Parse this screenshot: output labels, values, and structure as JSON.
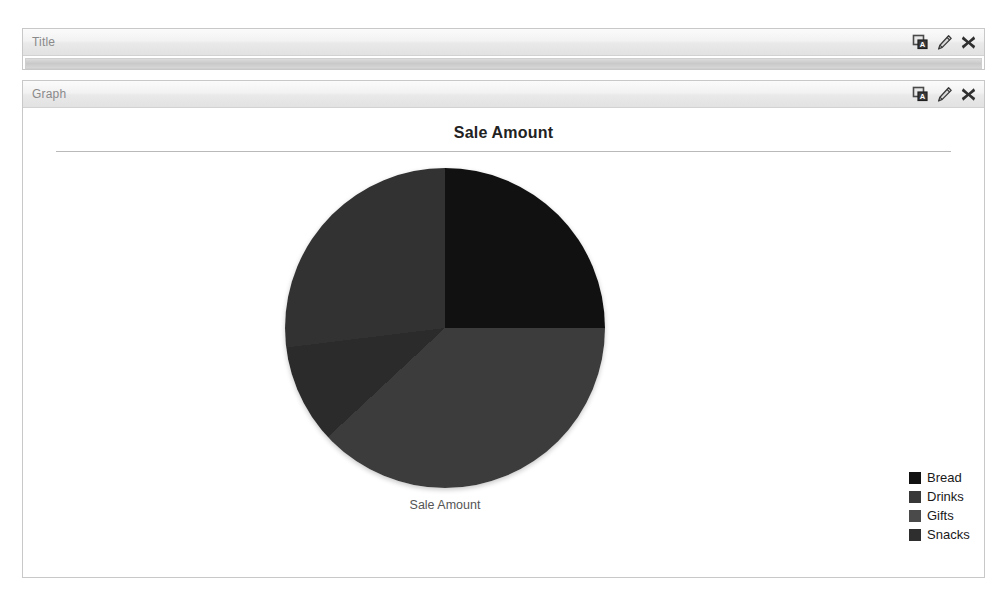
{
  "panels": [
    {
      "label": "Title",
      "state": "collapsed",
      "tools": [
        {
          "name": "rename-icon",
          "title": "Rename"
        },
        {
          "name": "edit-icon",
          "title": "Edit"
        },
        {
          "name": "delete-icon",
          "title": "Delete"
        }
      ]
    },
    {
      "label": "Graph",
      "state": "expanded",
      "tools": [
        {
          "name": "rename-icon",
          "title": "Rename"
        },
        {
          "name": "edit-icon",
          "title": "Edit"
        },
        {
          "name": "delete-icon",
          "title": "Delete"
        }
      ]
    }
  ],
  "chart_data": {
    "type": "pie",
    "title": "Sale Amount",
    "caption": "Sale Amount",
    "categories": [
      "Bread",
      "Drinks",
      "Gifts",
      "Snacks"
    ],
    "values": [
      25,
      27,
      10,
      38
    ],
    "unit": "%",
    "colors": [
      "#111111",
      "#383838",
      "#4a4a4a",
      "#2e2e2e"
    ],
    "legend_position": "right",
    "start_angle_deg": 0,
    "direction": "clockwise",
    "slices": [
      {
        "label": "Bread",
        "value": 25,
        "color": "#111111",
        "start_deg": 0,
        "end_deg": 90
      },
      {
        "label": "Snacks",
        "value": 38,
        "color": "#3c3c3c",
        "start_deg": 90,
        "end_deg": 227
      },
      {
        "label": "Gifts",
        "value": 10,
        "color": "#2b2b2b",
        "start_deg": 227,
        "end_deg": 263
      },
      {
        "label": "Drinks",
        "value": 27,
        "color": "#323232",
        "start_deg": 263,
        "end_deg": 360
      }
    ]
  },
  "colors": {
    "panel_border": "#c8c8c8",
    "header_text": "#8a8a8a",
    "chart_title": "#222222",
    "rule": "#b9b9b9"
  }
}
